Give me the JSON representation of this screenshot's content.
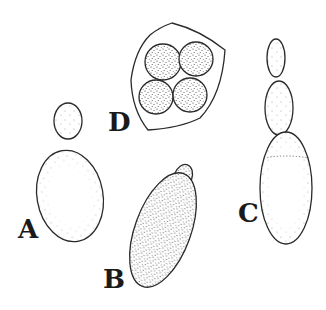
{
  "figure": {
    "colors": {
      "ink": "#2a2a2a",
      "background": "#ffffff"
    },
    "panels": [
      {
        "id": "A",
        "label": "A",
        "subject": "cell with single small bud"
      },
      {
        "id": "B",
        "label": "B",
        "subject": "elongated densely stippled cell with small bud"
      },
      {
        "id": "C",
        "label": "C",
        "subject": "chain of three budding cells"
      },
      {
        "id": "D",
        "label": "D",
        "subject": "ascus containing four spores"
      }
    ]
  }
}
